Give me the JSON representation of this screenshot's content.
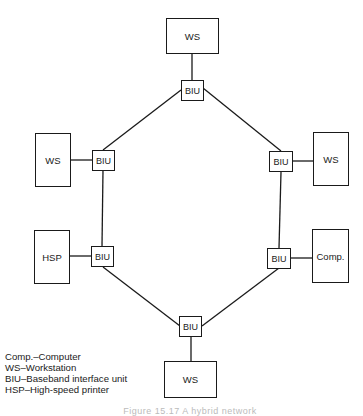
{
  "nodes": {
    "ws_top": "WS",
    "ws_left": "WS",
    "ws_right": "WS",
    "hsp": "HSP",
    "comp": "Comp.",
    "ws_bottom": "WS",
    "biu_top": "BIU",
    "biu_left_upper": "BIU",
    "biu_right_upper": "BIU",
    "biu_left_lower": "BIU",
    "biu_right_lower": "BIU",
    "biu_bottom": "BIU"
  },
  "legend": [
    "Comp.–Computer",
    "WS–Workstation",
    "BIU–Baseband interface unit",
    "HSP–High-speed printer"
  ],
  "caption": "Figure 15.17  A hybrid network"
}
